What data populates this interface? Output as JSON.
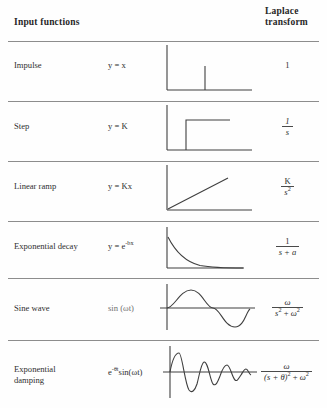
{
  "header": {
    "left": "Input functions",
    "right_line1": "Laplace",
    "right_line2": "transform"
  },
  "rows": [
    {
      "name": "Impulse",
      "function": "y = x",
      "graph": "impulse-spike",
      "transform_plain": "1",
      "transform_num": "1",
      "transform_den": ""
    },
    {
      "name": "Step",
      "function": "y = K",
      "graph": "unit-step",
      "transform_plain": "1/s",
      "transform_num": "1",
      "transform_den": "s"
    },
    {
      "name": "Linear ramp",
      "function": "y = Kx",
      "graph": "linear-ramp",
      "transform_plain": "K/s^2",
      "transform_num": "K",
      "transform_den": "s"
    },
    {
      "name": "Exponential decay",
      "function": "y = e",
      "function_exp": "-bx",
      "graph": "exponential-decay",
      "transform_plain": "1/(s + a)",
      "transform_num": "1",
      "transform_den": "s + a"
    },
    {
      "name": "Sine wave",
      "function": "sin (ωt)",
      "graph": "sine-wave",
      "transform_plain": "ω/(s^2 + ω^2)",
      "transform_num": "ω",
      "transform_den": "s"
    },
    {
      "name_line1": "Exponential",
      "name_line2": "damping",
      "function_base": "e",
      "function_exp": "-θt",
      "function_rest": "sin(ωt)",
      "graph": "exponential-damping",
      "transform_plain": "ω/((s + θ)^2 + ω^2)",
      "transform_num": "ω",
      "transform_den": "(s + θ)"
    }
  ],
  "symbols": {
    "omega": "ω",
    "theta": "θ",
    "exp_two": "2",
    "s": "s",
    "k": "K",
    "a": "a",
    "plus": "+"
  },
  "colors": {
    "ink": "#2b2b2b",
    "rule": "#8d8d8d",
    "curve": "#3a3a3a",
    "page": "#fefefe"
  }
}
